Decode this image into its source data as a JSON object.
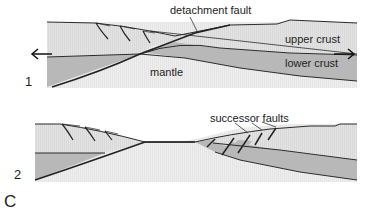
{
  "figure": {
    "panel_letter": "C",
    "colors": {
      "upper_crust": "#e1e1e1",
      "lower_crust": "#b6b6b6",
      "mantle": "#ececec",
      "lines": "#2b2b2b",
      "background": "#ffffff"
    },
    "panels": [
      {
        "number": "1",
        "labels": {
          "detachment_fault": "detachment fault",
          "upper_crust": "upper crust",
          "lower_crust": "lower crust",
          "mantle": "mantle"
        },
        "arrows": [
          "extension-left-arrow",
          "extension-right-arrow"
        ]
      },
      {
        "number": "2",
        "labels": {
          "successor_faults": "successor faults"
        }
      }
    ]
  }
}
